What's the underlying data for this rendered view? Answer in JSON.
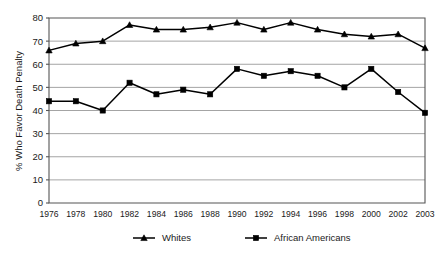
{
  "chart_data": {
    "type": "line",
    "title": "",
    "xlabel": "",
    "ylabel": "% Who Favor Death Penalty",
    "ylim": [
      0,
      80
    ],
    "yticks": [
      0,
      10,
      20,
      30,
      40,
      50,
      60,
      70,
      80
    ],
    "grid": true,
    "legend_position": "bottom",
    "categories": [
      "1976",
      "1978",
      "1980",
      "1982",
      "1984",
      "1986",
      "1988",
      "1990",
      "1992",
      "1994",
      "1996",
      "1998",
      "2000",
      "2002",
      "2003"
    ],
    "series": [
      {
        "name": "Whites",
        "marker": "triangle",
        "color": "#000000",
        "values": [
          66,
          69,
          70,
          77,
          75,
          75,
          76,
          78,
          75,
          78,
          75,
          73,
          72,
          73,
          67
        ]
      },
      {
        "name": "African Americans",
        "marker": "square",
        "color": "#000000",
        "values": [
          44,
          44,
          40,
          52,
          47,
          49,
          47,
          58,
          55,
          57,
          55,
          50,
          58,
          48,
          39
        ]
      }
    ]
  },
  "legend": {
    "items": [
      {
        "label": "Whites"
      },
      {
        "label": "African Americans"
      }
    ]
  },
  "axes": {
    "y_label": "% Who Favor Death Penalty",
    "y_tick_labels": [
      "0",
      "10",
      "20",
      "30",
      "40",
      "50",
      "60",
      "70",
      "80"
    ],
    "x_tick_labels": [
      "1976",
      "1978",
      "1980",
      "1982",
      "1984",
      "1986",
      "1988",
      "1990",
      "1992",
      "1994",
      "1996",
      "1998",
      "2000",
      "2002",
      "2003"
    ]
  }
}
